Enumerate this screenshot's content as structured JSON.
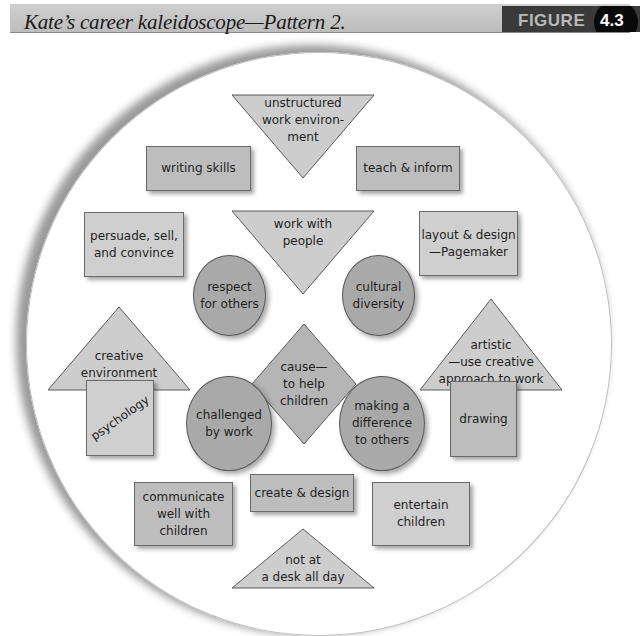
{
  "header": {
    "title": "Kate’s career kaleidoscope—Pattern 2.",
    "figure_label": "FIGURE",
    "figure_number": "4.3"
  },
  "colors": {
    "header_bg": "#c4c4c4",
    "figure_box_bg": "#3a3a3a",
    "rect_fill": "#bdbdbd",
    "rect_fill_light": "#cfcfcf",
    "triangle_fill": "#cdcdcd",
    "circle_fill": "#a9a9a9",
    "diamond_fill": "#b5b5b5",
    "stroke": "#5a5a5a"
  },
  "diagram": {
    "title": "Kate’s career kaleidoscope—Pattern 2.",
    "shape_legend_note": "Shapes grouped by category within a large circle",
    "shapes": {
      "unstructured": {
        "type": "triangle-down",
        "text": "unstructured\nwork environ-\nment"
      },
      "writing": {
        "type": "rectangle",
        "text": "writing skills"
      },
      "teach": {
        "type": "rectangle",
        "text": "teach & inform"
      },
      "persuade": {
        "type": "rectangle",
        "text": "persuade, sell,\nand convince"
      },
      "work_people": {
        "type": "triangle-down",
        "text": "work with\npeople"
      },
      "layout": {
        "type": "rectangle",
        "text": "layout & design\n—Pagemaker"
      },
      "respect": {
        "type": "circle",
        "text": "respect\nfor others"
      },
      "cultural": {
        "type": "circle",
        "text": "cultural\ndiversity"
      },
      "creative_env": {
        "type": "triangle-up",
        "text": "creative\nenvironment"
      },
      "cause": {
        "type": "diamond",
        "text": "cause—\nto help\nchildren"
      },
      "artistic": {
        "type": "triangle-up",
        "text": "artistic\n—use creative\napproach to work"
      },
      "psychology": {
        "type": "square",
        "text": "psychology"
      },
      "challenged": {
        "type": "circle",
        "text": "challenged\nby work"
      },
      "difference": {
        "type": "circle",
        "text": "making a\ndifference\nto others"
      },
      "drawing": {
        "type": "square",
        "text": "drawing"
      },
      "communicate": {
        "type": "rectangle",
        "text": "communicate\nwell with\nchildren"
      },
      "create": {
        "type": "rectangle",
        "text": "create & design"
      },
      "entertain": {
        "type": "rectangle",
        "text": "entertain\nchildren"
      },
      "not_desk": {
        "type": "triangle-up",
        "text": "not at\na desk all day"
      }
    }
  }
}
